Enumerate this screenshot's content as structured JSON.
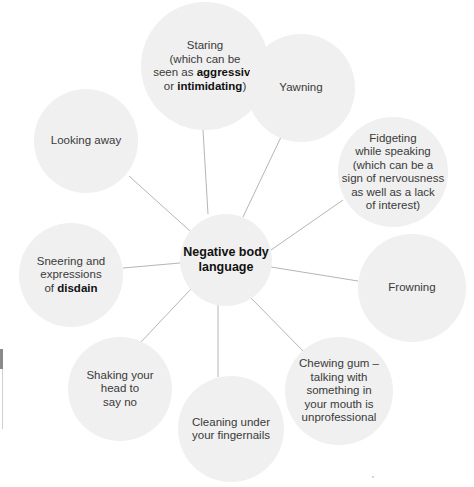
{
  "diagram": {
    "title": "Negative body language",
    "center": {
      "label": "Negative body language",
      "lines": [
        "Negative body",
        "language"
      ],
      "cx": 226,
      "cy": 260,
      "r": 46
    },
    "line_color": "#b5b5b5",
    "node_fill": "#f0f0f0",
    "text_color": "#3a3a3a",
    "bold_color": "#111111",
    "nodes": [
      {
        "id": "staring",
        "cx": 205,
        "cy": 66,
        "r": 64,
        "lines": [
          [
            {
              "t": "Staring"
            }
          ],
          [
            {
              "t": "(which can be"
            }
          ],
          [
            {
              "t": "seen as "
            },
            {
              "t": "aggressive",
              "b": true
            }
          ],
          [
            {
              "t": "or "
            },
            {
              "t": "intimidating",
              "b": true
            },
            {
              "t": ")"
            }
          ]
        ],
        "text": "Staring (which can be seen as aggressive or intimidating)"
      },
      {
        "id": "yawning",
        "cx": 301,
        "cy": 88,
        "r": 54,
        "lines": [
          [
            {
              "t": "Yawning"
            }
          ]
        ],
        "text": "Yawning"
      },
      {
        "id": "looking-away",
        "cx": 86,
        "cy": 141,
        "r": 52,
        "lines": [
          [
            {
              "t": "Looking away"
            }
          ]
        ],
        "text": "Looking away"
      },
      {
        "id": "fidgeting",
        "cx": 393,
        "cy": 172,
        "r": 55,
        "lines": [
          [
            {
              "t": "Fidgeting"
            }
          ],
          [
            {
              "t": "while speaking"
            }
          ],
          [
            {
              "t": "(which can be a"
            }
          ],
          [
            {
              "t": "sign of nervousness"
            }
          ],
          [
            {
              "t": "as well as a lack"
            }
          ],
          [
            {
              "t": "of interest)"
            }
          ]
        ],
        "text": "Fidgeting while speaking (which can be a sign of nervousness as well as a lack of interest)"
      },
      {
        "id": "sneering",
        "cx": 71,
        "cy": 275,
        "r": 52,
        "lines": [
          [
            {
              "t": "Sneering and"
            }
          ],
          [
            {
              "t": "expressions"
            }
          ],
          [
            {
              "t": "of "
            },
            {
              "t": "disdain",
              "b": true
            }
          ]
        ],
        "text": "Sneering and expressions of disdain"
      },
      {
        "id": "frowning",
        "cx": 412,
        "cy": 288,
        "r": 54,
        "lines": [
          [
            {
              "t": "Frowning"
            }
          ]
        ],
        "text": "Frowning"
      },
      {
        "id": "shaking-head",
        "cx": 120,
        "cy": 389,
        "r": 52,
        "lines": [
          [
            {
              "t": "Shaking your"
            }
          ],
          [
            {
              "t": "head to"
            }
          ],
          [
            {
              "t": "say no"
            }
          ]
        ],
        "text": "Shaking your head to say no"
      },
      {
        "id": "chewing-gum",
        "cx": 339,
        "cy": 391,
        "r": 54,
        "lines": [
          [
            {
              "t": "Chewing gum –"
            }
          ],
          [
            {
              "t": "talking with"
            }
          ],
          [
            {
              "t": "something in"
            }
          ],
          [
            {
              "t": "your mouth is"
            }
          ],
          [
            {
              "t": "unprofessional"
            }
          ]
        ],
        "text": "Chewing gum – talking with something in your mouth is unprofessional"
      },
      {
        "id": "cleaning-fingernails",
        "cx": 231,
        "cy": 429,
        "r": 53,
        "lines": [
          [
            {
              "t": "Cleaning under"
            }
          ],
          [
            {
              "t": "your fingernails"
            }
          ]
        ],
        "text": "Cleaning under your fingernails"
      }
    ],
    "edges": [
      {
        "to": "staring",
        "x1": 208,
        "y1": 214,
        "x2": 203,
        "y2": 130
      },
      {
        "to": "yawning",
        "x1": 243,
        "y1": 217,
        "x2": 281,
        "y2": 137
      },
      {
        "to": "looking-away",
        "x1": 190,
        "y1": 231,
        "x2": 129,
        "y2": 176
      },
      {
        "to": "fidgeting",
        "x1": 271,
        "y1": 250,
        "x2": 343,
        "y2": 200
      },
      {
        "to": "sneering",
        "x1": 180,
        "y1": 263,
        "x2": 123,
        "y2": 268
      },
      {
        "to": "frowning",
        "x1": 271,
        "y1": 267,
        "x2": 358,
        "y2": 281
      },
      {
        "to": "shaking-head",
        "x1": 191,
        "y1": 289,
        "x2": 140,
        "y2": 343
      },
      {
        "to": "chewing-gum",
        "x1": 251,
        "y1": 298,
        "x2": 304,
        "y2": 352
      },
      {
        "to": "cleaning-fingernails",
        "x1": 218,
        "y1": 305,
        "x2": 218,
        "y2": 377
      }
    ]
  }
}
